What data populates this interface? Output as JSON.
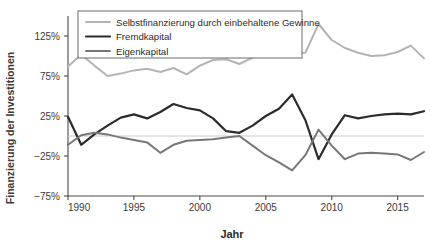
{
  "chart_data": {
    "type": "line",
    "title": "",
    "xlabel": "Jahr",
    "ylabel": "Finanzierung der Investitionen",
    "xlim": [
      1990,
      2017
    ],
    "ylim": [
      -75,
      150
    ],
    "yticks": [
      -75,
      -25,
      25,
      75,
      125
    ],
    "ytick_labels": [
      "−75%",
      "−25%",
      "25%",
      "75%",
      "125%"
    ],
    "xticks": [
      1990,
      1995,
      2000,
      2005,
      2010,
      2015
    ],
    "xtick_labels": [
      "1990",
      "1995",
      "2000",
      "2005",
      "2010",
      "2015"
    ],
    "grid": false,
    "zero_line": true,
    "legend_position": "top-left",
    "x": [
      1990,
      1991,
      1992,
      1993,
      1994,
      1995,
      1996,
      1997,
      1998,
      1999,
      2000,
      2001,
      2002,
      2003,
      2004,
      2005,
      2006,
      2007,
      2008,
      2009,
      2010,
      2011,
      2012,
      2013,
      2014,
      2015,
      2016,
      2017
    ],
    "series": [
      {
        "name": "Selbstfinanzierung durch einbehaltene Gewinne",
        "color": "#b4b4b4",
        "width": 2.0,
        "values": [
          87,
          102,
          88,
          75,
          78,
          82,
          84,
          80,
          85,
          77,
          88,
          95,
          96,
          90,
          98,
          103,
          101,
          103,
          104,
          140,
          120,
          110,
          104,
          100,
          101,
          105,
          113,
          97
        ]
      },
      {
        "name": "Fremdkapital",
        "color": "#2b2b2b",
        "width": 2.2,
        "values": [
          24,
          -11,
          2,
          13,
          23,
          27,
          22,
          30,
          40,
          35,
          32,
          22,
          6,
          4,
          13,
          25,
          34,
          52,
          20,
          -29,
          2,
          26,
          22,
          25,
          27,
          28,
          27,
          31
        ]
      },
      {
        "name": "Eigenkapital",
        "color": "#777777",
        "width": 2.0,
        "values": [
          -11,
          1,
          4,
          2,
          -2,
          -5,
          -8,
          -21,
          -11,
          -6,
          -5,
          -4,
          -2,
          0,
          -12,
          -24,
          -33,
          -43,
          -24,
          8,
          -12,
          -29,
          -22,
          -21,
          -22,
          -23,
          -30,
          -20
        ]
      }
    ]
  },
  "legend": {
    "items": [
      {
        "label": "Selbstfinanzierung durch einbehaltene Gewinne",
        "color": "#b4b4b4"
      },
      {
        "label": "Fremdkapital",
        "color": "#2b2b2b"
      },
      {
        "label": "Eigenkapital",
        "color": "#777777"
      }
    ]
  },
  "axes": {
    "y_title": "Finanzierung der Investitionen",
    "x_title": "Jahr"
  }
}
